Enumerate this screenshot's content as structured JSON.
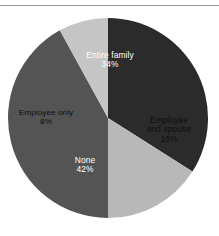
{
  "figure": {
    "background_color": "#ffffff",
    "rule_color": "#9a9a9a"
  },
  "chart_data": {
    "type": "pie",
    "title": "",
    "subtitle": "",
    "xlabel": "",
    "ylabel": "",
    "legend_position": "none",
    "grid": false,
    "labels_inside_slices": true,
    "start_angle_deg": 0,
    "direction": "clockwise",
    "categories": [
      "Entire family",
      "Employee and spouse",
      "None",
      "Employee only"
    ],
    "values": [
      34,
      16,
      42,
      8
    ],
    "value_suffix": "%",
    "colors": [
      "#2b2b2b",
      "#b8b8b8",
      "#545454",
      "#c5c5c5"
    ],
    "label_text_colors": [
      "#ffffff",
      "#0d0d0d",
      "#ffffff",
      "#0d0d0d"
    ],
    "slices": [
      {
        "name": "Entire family",
        "value": 34,
        "value_label": "34%",
        "color": "#2b2b2b",
        "text_color": "#ffffff",
        "start_angle_deg": 0,
        "end_angle_deg": 122.4
      },
      {
        "name": "Employee and spouse",
        "name_line_1": "Employee",
        "name_line_2": "and spouse",
        "value": 16,
        "value_label": "16%",
        "color": "#b8b8b8",
        "text_color": "#0d0d0d",
        "start_angle_deg": 122.4,
        "end_angle_deg": 180.0
      },
      {
        "name": "None",
        "value": 42,
        "value_label": "42%",
        "color": "#545454",
        "text_color": "#ffffff",
        "start_angle_deg": 180.0,
        "end_angle_deg": 331.2
      },
      {
        "name": "Employee only",
        "value": 8,
        "value_label": "8%",
        "color": "#c5c5c5",
        "text_color": "#0d0d0d",
        "start_angle_deg": 331.2,
        "end_angle_deg": 360.0
      }
    ],
    "geometry": {
      "center_x": 108,
      "center_y": 118,
      "radius": 100
    }
  }
}
